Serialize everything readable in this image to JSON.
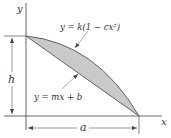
{
  "diagram": {
    "type": "area between curve and line",
    "axes": {
      "x_label": "x",
      "y_label": "y"
    },
    "curves": {
      "parabola_label": "y = k(1 − cx²)",
      "line_label": "y = mx + b"
    },
    "dimensions": {
      "height_label": "h",
      "width_label": "a"
    },
    "colors": {
      "shaded_region": "#c9c9c9",
      "lines": "#444444",
      "background": "#ffffff"
    }
  }
}
